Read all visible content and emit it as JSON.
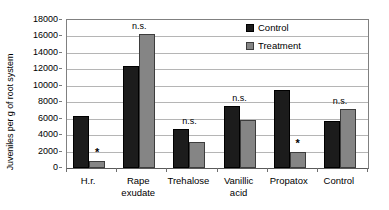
{
  "chart_data": {
    "type": "bar",
    "title": "",
    "xlabel": "",
    "ylabel": "Juveniles per g of root system",
    "ylim": [
      0,
      18000
    ],
    "ytick_step": 2000,
    "grid": true,
    "legend_position": "top-right",
    "categories": [
      "H.r.",
      "Rape\nexudate",
      "Trehalose",
      "Vanillic\nacid",
      "Propatox",
      "Control"
    ],
    "yticks": [
      "18000",
      "16000",
      "14000",
      "12000",
      "10000",
      "8000",
      "6000",
      "4000",
      "2000",
      "0"
    ],
    "series": [
      {
        "name": "Control",
        "color": "#1c1c1c",
        "values": [
          6300,
          12400,
          4700,
          7550,
          9450,
          5750
        ]
      },
      {
        "name": "Treatment",
        "color": "#858585",
        "values": [
          800,
          16300,
          3150,
          5900,
          2000,
          7150
        ]
      }
    ],
    "annotations": [
      {
        "category": "H.r.",
        "text": "*",
        "target": "treatment"
      },
      {
        "category": "Rape\nexudate",
        "text": "n.s.",
        "target": "group"
      },
      {
        "category": "Trehalose",
        "text": "n.s.",
        "target": "group"
      },
      {
        "category": "Vanillic\nacid",
        "text": "n.s.",
        "target": "group"
      },
      {
        "category": "Propatox",
        "text": "*",
        "target": "treatment"
      },
      {
        "category": "Control",
        "text": "n.s.",
        "target": "group"
      }
    ]
  },
  "legend": {
    "entries": [
      {
        "label": "Control"
      },
      {
        "label": "Treatment"
      }
    ]
  },
  "colors": {
    "control": "#1c1c1c",
    "treatment": "#858585",
    "gridline": "#b5b5b5",
    "axis": "#808080",
    "background": "#ffffff",
    "text": "#000000"
  }
}
